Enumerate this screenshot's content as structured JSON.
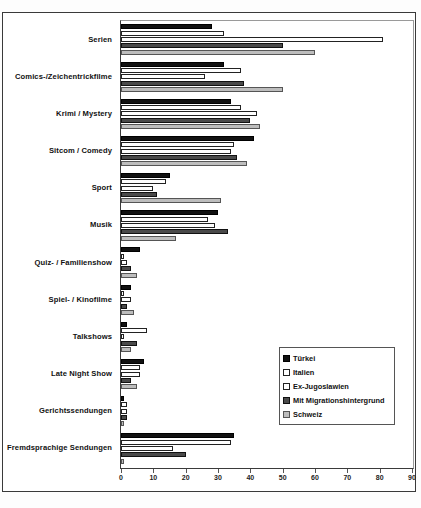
{
  "chart_data": {
    "type": "bar",
    "orientation": "horizontal",
    "title": "",
    "xlabel": "",
    "ylabel": "",
    "xlim": [
      0,
      90
    ],
    "xticks": [
      0,
      10,
      20,
      30,
      40,
      50,
      60,
      70,
      80,
      90
    ],
    "grid": false,
    "legend_position": "inside-bottom-right",
    "categories": [
      "Serien",
      "Comics-/Zeichentrickfilme",
      "Krimi / Mystery",
      "Sitcom / Comedy",
      "Sport",
      "Musik",
      "Quiz- / Familienshow",
      "Spiel- / Kinofilme",
      "Talkshows",
      "Late Night Show",
      "Gerichtssendungen",
      "Fremdsprachige Sendungen"
    ],
    "series": [
      {
        "name": "Türkei",
        "color": "#111111",
        "values": [
          28,
          32,
          34,
          41,
          15,
          30,
          6,
          3,
          2,
          7,
          1,
          35
        ]
      },
      {
        "name": "Italien",
        "color": "#ffffff",
        "values": [
          32,
          37,
          37,
          35,
          14,
          27,
          1,
          1,
          8,
          6,
          2,
          34
        ]
      },
      {
        "name": "Ex-Jugoslawien",
        "color": "#ffffff",
        "values": [
          81,
          26,
          42,
          34,
          10,
          29,
          2,
          3,
          1,
          6,
          2,
          16
        ]
      },
      {
        "name": "Mit Migrationshintergrund",
        "color": "#4a4a4a",
        "values": [
          50,
          38,
          40,
          36,
          11,
          33,
          3,
          2,
          5,
          3,
          2,
          20
        ]
      },
      {
        "name": "Schweiz",
        "color": "#bdbdbd",
        "values": [
          60,
          50,
          43,
          39,
          31,
          17,
          5,
          4,
          3,
          5,
          1,
          1
        ]
      }
    ]
  },
  "legend": {
    "items": [
      {
        "label": "Türkei"
      },
      {
        "label": "Italien"
      },
      {
        "label": "Ex-Jugoslawien"
      },
      {
        "label": "Mit Migrationshintergrund"
      },
      {
        "label": "Schweiz"
      }
    ]
  }
}
